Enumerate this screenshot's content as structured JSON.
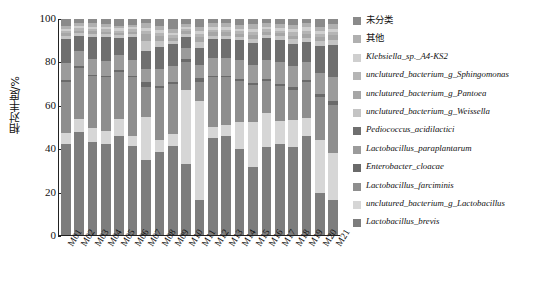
{
  "chart_data": {
    "type": "bar",
    "title": "",
    "subtitle": "",
    "stacked": true,
    "orientation": "vertical",
    "xlabel": "",
    "ylabel": "相对丰度/%",
    "ylim": [
      0,
      100
    ],
    "yticks": [
      0,
      20,
      40,
      60,
      80,
      100
    ],
    "grid": false,
    "legend_position": "right",
    "categories": [
      "M01",
      "M02",
      "M03",
      "M04",
      "M05",
      "M06",
      "M07",
      "M08",
      "M09",
      "M10",
      "M11",
      "M12",
      "M13",
      "M14",
      "M15",
      "M16",
      "M17",
      "M18",
      "M19",
      "M20",
      "M21"
    ],
    "series": [
      {
        "name": "Lactobacillus_brevis",
        "color": "#7d7d7d",
        "values": [
          42.0,
          47.5,
          43.0,
          42.0,
          46.0,
          41.0,
          34.5,
          38.5,
          41.0,
          33.0,
          16.0,
          45.0,
          46.0,
          40.0,
          32.0,
          41.0,
          42.0,
          41.0,
          46.0,
          20.0,
          16.0
        ]
      },
      {
        "name": "unclutured_bacterium_g_Lactobacillus",
        "color": "#d6d6d6",
        "values": [
          5.0,
          6.0,
          6.5,
          6.0,
          7.5,
          5.0,
          20.0,
          5.5,
          6.0,
          35.0,
          46.0,
          5.0,
          5.0,
          13.0,
          21.0,
          16.0,
          11.0,
          13.0,
          8.0,
          25.0,
          22.0
        ]
      },
      {
        "name": "Lactobacillus_farciminis",
        "color": "#8e8e8e",
        "values": [
          24.0,
          24.0,
          24.0,
          25.0,
          22.0,
          27.0,
          14.0,
          24.0,
          23.0,
          13.0,
          9.0,
          23.0,
          22.0,
          19.0,
          17.0,
          15.0,
          16.0,
          14.0,
          17.0,
          20.0,
          22.0
        ]
      },
      {
        "name": "Enterobacter_cloacae",
        "color": "#6a6a6a",
        "values": [
          0.8,
          0.8,
          0.7,
          0.7,
          0.8,
          0.7,
          2.5,
          1.0,
          0.8,
          1.5,
          1.5,
          0.8,
          0.8,
          1.0,
          1.2,
          1.0,
          1.0,
          1.0,
          0.8,
          1.5,
          2.0
        ]
      },
      {
        "name": "Lactobacillus_paraplantarum",
        "color": "#9b9b9b",
        "values": [
          8.0,
          7.0,
          7.5,
          7.0,
          7.0,
          7.5,
          6.0,
          8.0,
          7.5,
          5.0,
          6.0,
          8.0,
          8.0,
          9.0,
          8.5,
          9.0,
          10.0,
          10.0,
          8.5,
          10.0,
          11.0
        ]
      },
      {
        "name": "Pediococcus_acidilactici",
        "color": "#6f6f6f",
        "values": [
          11.0,
          7.0,
          10.0,
          11.0,
          8.0,
          10.5,
          8.0,
          10.0,
          10.0,
          5.0,
          8.0,
          9.0,
          9.0,
          9.0,
          10.0,
          10.0,
          10.5,
          10.5,
          9.0,
          13.0,
          15.0
        ]
      },
      {
        "name": "unclutured_bacterium_g_Weissella",
        "color": "#c4c4c4",
        "values": [
          1.2,
          1.2,
          1.5,
          1.2,
          1.2,
          1.2,
          5.0,
          3.0,
          1.5,
          1.5,
          3.0,
          1.5,
          1.5,
          1.5,
          2.0,
          1.5,
          1.5,
          2.0,
          2.0,
          2.0,
          2.5
        ]
      },
      {
        "name": "unclutured_bacterium_g_Pantoea",
        "color": "#a6a6a6",
        "values": [
          1.5,
          1.2,
          1.3,
          1.3,
          1.2,
          1.3,
          3.0,
          2.0,
          1.5,
          1.3,
          2.0,
          1.5,
          1.5,
          1.5,
          1.8,
          1.5,
          1.5,
          1.8,
          1.8,
          1.8,
          2.0
        ]
      },
      {
        "name": "unclutured_bacterium_g_Sphingomonas",
        "color": "#b5b5b5",
        "values": [
          1.0,
          1.0,
          1.0,
          1.0,
          1.0,
          1.0,
          1.5,
          1.5,
          1.2,
          1.0,
          1.5,
          1.2,
          1.2,
          1.2,
          1.5,
          1.2,
          1.2,
          1.5,
          1.5,
          1.5,
          1.5
        ]
      },
      {
        "name": "Klebsiella_sp._A4-KS2",
        "color": "#cfcfcf",
        "values": [
          1.0,
          1.0,
          1.0,
          1.0,
          1.0,
          1.0,
          1.5,
          1.5,
          1.2,
          1.0,
          1.5,
          1.2,
          1.2,
          1.3,
          1.5,
          1.3,
          1.3,
          1.5,
          1.5,
          1.5,
          1.5
        ]
      },
      {
        "name": "其他",
        "color": "#b0b0b0",
        "values": [
          1.5,
          1.3,
          1.5,
          1.3,
          1.3,
          1.3,
          2.0,
          2.0,
          1.8,
          1.2,
          2.0,
          1.8,
          1.8,
          1.8,
          2.0,
          1.8,
          1.8,
          2.0,
          2.0,
          2.0,
          2.0
        ]
      },
      {
        "name": "未分类",
        "color": "#8a8a8a",
        "values": [
          3.0,
          2.0,
          2.0,
          2.5,
          3.0,
          2.5,
          2.0,
          3.0,
          4.5,
          2.5,
          3.5,
          2.0,
          2.0,
          2.7,
          2.5,
          1.7,
          2.2,
          2.7,
          1.9,
          3.7,
          2.5
        ]
      }
    ]
  },
  "axes": {
    "y_label": "相对丰度/%",
    "y_ticks": [
      "100",
      "80",
      "60",
      "40",
      "20",
      "0"
    ],
    "x_ticks": [
      "M01",
      "M02",
      "M03",
      "M04",
      "M05",
      "M06",
      "M07",
      "M08",
      "M09",
      "M10",
      "M11",
      "M12",
      "M13",
      "M14",
      "M15",
      "M16",
      "M17",
      "M18",
      "M19",
      "M20",
      "M21"
    ]
  },
  "legend": {
    "items": [
      {
        "label": "未分类",
        "color": "#8a8a8a",
        "style": "zh"
      },
      {
        "label": "其他",
        "color": "#b0b0b0",
        "style": "zh"
      },
      {
        "label": "Klebsiella_sp._A4-KS2",
        "color": "#cfcfcf",
        "style": "it"
      },
      {
        "label": "unclutured_bacterium_g_Sphingomonas",
        "color": "#b5b5b5",
        "style": "it"
      },
      {
        "label": "unclutured_bacterium_g_Pantoea",
        "color": "#a6a6a6",
        "style": "it"
      },
      {
        "label": "unclutured_bacterium_g_Weissella",
        "color": "#c4c4c4",
        "style": "it"
      },
      {
        "label": "Pediococcus_acidilactici",
        "color": "#6f6f6f",
        "style": "it"
      },
      {
        "label": "Lactobacillus_paraplantarum",
        "color": "#9b9b9b",
        "style": "it"
      },
      {
        "label": "Enterobacter_cloacae",
        "color": "#6a6a6a",
        "style": "it"
      },
      {
        "label": "Lactobacillus_farciminis",
        "color": "#8e8e8e",
        "style": "it"
      },
      {
        "label": "unclutured_bacterium_g_Lactobacillus",
        "color": "#d6d6d6",
        "style": "it"
      },
      {
        "label": "Lactobacillus_brevis",
        "color": "#7d7d7d",
        "style": "it"
      }
    ]
  }
}
